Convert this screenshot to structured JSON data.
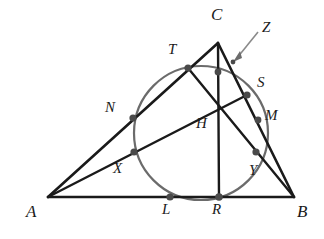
{
  "figure": {
    "type": "geometry-diagram",
    "canvas": {
      "width": 324,
      "height": 239
    },
    "colors": {
      "background": "#ffffff",
      "stroke": "#1a1a1a",
      "circle_stroke": "#6b6b6b",
      "point_fill": "#4a4a4a",
      "label_text": "#1a1a1a",
      "leader_line": "#8a8a8a"
    },
    "vertices": [
      {
        "name": "A",
        "label": "A",
        "x": 48,
        "y": 197,
        "label_x": 26,
        "label_y": 209
      },
      {
        "name": "B",
        "label": "B",
        "x": 294,
        "y": 197,
        "label_x": 297,
        "label_y": 209
      },
      {
        "name": "C",
        "label": "C",
        "x": 218,
        "y": 43,
        "label_x": 212,
        "label_y": 9
      }
    ],
    "points": [
      {
        "name": "T",
        "label": "T",
        "x": 188,
        "y": 68,
        "label_x": 169,
        "label_y": 46,
        "dot": true
      },
      {
        "name": "N",
        "label": "N",
        "x": 133,
        "y": 118,
        "label_x": 106,
        "label_y": 104,
        "dot": true
      },
      {
        "name": "S",
        "label": "S",
        "x": 247,
        "y": 95,
        "label_x": 258,
        "label_y": 80,
        "dot": true
      },
      {
        "name": "M",
        "label": "M",
        "x": 258,
        "y": 120,
        "label_x": 266,
        "label_y": 113,
        "dot": true
      },
      {
        "name": "H",
        "label": "H",
        "x": 218,
        "y": 108,
        "label_x": 197,
        "label_y": 122,
        "dot": false
      },
      {
        "name": "X",
        "label": "X",
        "x": 134,
        "y": 152,
        "label_x": 114,
        "label_y": 167,
        "dot": true
      },
      {
        "name": "Y",
        "label": "Y",
        "x": 256,
        "y": 152,
        "label_x": 250,
        "label_y": 169,
        "dot": true
      },
      {
        "name": "L",
        "label": "L",
        "x": 170,
        "y": 197,
        "label_x": 163,
        "label_y": 206,
        "dot": true
      },
      {
        "name": "R",
        "label": "R",
        "x": 219,
        "y": 197,
        "label_x": 213,
        "label_y": 206,
        "dot": true
      },
      {
        "name": "Z",
        "label": "Z",
        "x": 233,
        "y": 62,
        "label_x": 263,
        "label_y": 24,
        "dot": false
      }
    ],
    "unlabeled_points": [
      {
        "name": "circle-top-on-altitude",
        "x": 218,
        "y": 72
      }
    ],
    "segments": [
      {
        "name": "side-AB",
        "from": "A",
        "to": "B",
        "x1": 48,
        "y1": 197,
        "x2": 294,
        "y2": 197
      },
      {
        "name": "side-AC",
        "from": "A",
        "to": "C",
        "x1": 48,
        "y1": 197,
        "x2": 218,
        "y2": 43
      },
      {
        "name": "side-CB",
        "from": "C",
        "to": "B",
        "x1": 218,
        "y1": 43,
        "x2": 294,
        "y2": 197
      },
      {
        "name": "altitude-CR",
        "from": "C",
        "to": "R",
        "x1": 218,
        "y1": 43,
        "x2": 219,
        "y2": 197
      },
      {
        "name": "altitude-AS",
        "from": "A",
        "to": "S",
        "x1": 48,
        "y1": 197,
        "x2": 247,
        "y2": 95
      },
      {
        "name": "altitude-BT",
        "from": "B",
        "to": "T",
        "x1": 294,
        "y1": 197,
        "x2": 188,
        "y2": 68
      }
    ],
    "circle": {
      "name": "nine-point-circle",
      "cx": 201,
      "cy": 133,
      "r": 67
    },
    "leader": {
      "name": "z-leader-line",
      "x1": 258,
      "y1": 32,
      "x2": 235,
      "y2": 60
    }
  }
}
